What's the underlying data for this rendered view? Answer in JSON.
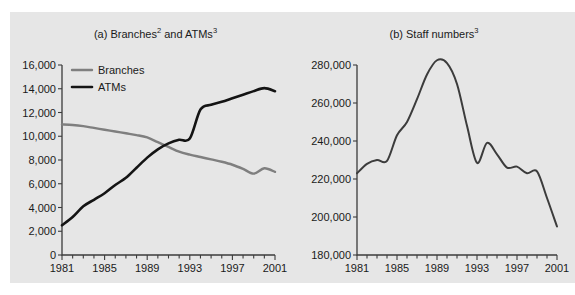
{
  "figure": {
    "background_color": "#e6e6e6",
    "page_background": "#ffffff"
  },
  "panels": {
    "a": {
      "title_prefix": "(a) Branches",
      "title_sup1": "2",
      "title_middle": " and ATMs",
      "title_sup2": "3"
    },
    "b": {
      "title_prefix": "(b) Staff numbers",
      "title_sup1": "3"
    }
  },
  "legend": {
    "items": [
      {
        "label": "Branches",
        "color": "#7f7f7f"
      },
      {
        "label": "ATMs",
        "color": "#141414"
      }
    ]
  },
  "chart_data": [
    {
      "type": "line",
      "title": "(a) Branches2 and ATMs3",
      "xlabel": "",
      "ylabel": "",
      "xlim": [
        1981,
        2001
      ],
      "ylim": [
        0,
        16000
      ],
      "yticks": [
        0,
        2000,
        4000,
        6000,
        8000,
        10000,
        12000,
        14000,
        16000
      ],
      "ytick_labels": [
        "0",
        "2,000",
        "4,000",
        "6,000",
        "8,000",
        "10,000",
        "12,000",
        "14,000",
        "16,000"
      ],
      "xticks": [
        1981,
        1985,
        1989,
        1993,
        1997,
        2001
      ],
      "xtick_labels": [
        "1981",
        "1985",
        "1989",
        "1993",
        "1997",
        "2001"
      ],
      "minor_xticks_every": 1,
      "grid": false,
      "legend_position": "upper-left",
      "x": [
        1981,
        1982,
        1983,
        1984,
        1985,
        1986,
        1987,
        1988,
        1989,
        1990,
        1991,
        1992,
        1993,
        1994,
        1995,
        1996,
        1997,
        1998,
        1999,
        2000,
        2001
      ],
      "series": [
        {
          "name": "Branches",
          "color": "#7f7f7f",
          "values": [
            11000,
            10950,
            10850,
            10700,
            10550,
            10400,
            10250,
            10100,
            9900,
            9500,
            9100,
            8700,
            8450,
            8250,
            8050,
            7850,
            7600,
            7250,
            6850,
            7300,
            7000
          ]
        },
        {
          "name": "ATMs",
          "color": "#141414",
          "values": [
            2500,
            3200,
            4100,
            4650,
            5200,
            5900,
            6500,
            7350,
            8200,
            8900,
            9400,
            9700,
            9800,
            12250,
            12650,
            12900,
            13200,
            13500,
            13800,
            14050,
            13800
          ]
        }
      ]
    },
    {
      "type": "line",
      "title": "(b) Staff numbers3",
      "xlabel": "",
      "ylabel": "",
      "xlim": [
        1981,
        2001
      ],
      "ylim": [
        180000,
        280000
      ],
      "yticks": [
        180000,
        200000,
        220000,
        240000,
        260000,
        280000
      ],
      "ytick_labels": [
        "180,000",
        "200,000",
        "220,000",
        "240,000",
        "260,000",
        "280,000"
      ],
      "xticks": [
        1981,
        1985,
        1989,
        1993,
        1997,
        2001
      ],
      "xtick_labels": [
        "1981",
        "1985",
        "1989",
        "1993",
        "1997",
        "2001"
      ],
      "minor_xticks_every": 1,
      "grid": false,
      "legend_position": "none",
      "x": [
        1981,
        1982,
        1983,
        1984,
        1985,
        1986,
        1987,
        1988,
        1989,
        1990,
        1991,
        1992,
        1993,
        1994,
        1995,
        1996,
        1997,
        1998,
        1999,
        2000,
        2001
      ],
      "series": [
        {
          "name": "Staff numbers",
          "color": "#3c3c3c",
          "values": [
            223000,
            228000,
            230000,
            229500,
            243000,
            250000,
            262000,
            275000,
            282500,
            281000,
            270000,
            248000,
            228500,
            239000,
            233000,
            226000,
            226500,
            223000,
            224000,
            210000,
            195000
          ]
        }
      ]
    }
  ]
}
